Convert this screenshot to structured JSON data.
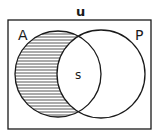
{
  "diagram": {
    "type": "venn",
    "universe_label": "u",
    "sets": [
      {
        "name": "A",
        "label": "A",
        "shaded": "A minus P"
      },
      {
        "name": "P",
        "label": "P",
        "shaded": "none"
      }
    ],
    "intersection_label": "s",
    "shaded_region": "A only (A ∩ P′)",
    "shading_pattern": "horizontal-lines",
    "colors": {
      "stroke": "#1a1a1a",
      "background": "#ffffff",
      "hatch": "#555555"
    }
  }
}
